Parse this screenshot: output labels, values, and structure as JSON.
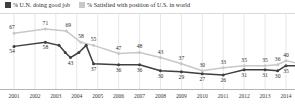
{
  "legend": {
    "series": [
      {
        "label": "% U.N. doing good job",
        "color": "#3f3f3f",
        "swatch": "dark"
      },
      {
        "label": "% Satisfied with position of U.S. in world",
        "color": "#c8c8c8",
        "swatch": "light"
      }
    ]
  },
  "axis": {
    "years": [
      "2001",
      "2002",
      "2003",
      "2004",
      "2005",
      "2006",
      "2007",
      "2008",
      "2009",
      "2010",
      "2011",
      "2012",
      "2013",
      "2014"
    ]
  },
  "chart_data": {
    "type": "line",
    "title": "",
    "subtitle": "",
    "xlabel": "",
    "ylabel": "",
    "ylim": [
      20,
      75
    ],
    "grid": "vertical-only",
    "legend_position": "top-left",
    "x_tick_labels": [
      "2001",
      "2002",
      "2003",
      "2004",
      "2005",
      "2006",
      "2007",
      "2008",
      "2009",
      "2010",
      "2011",
      "2012",
      "2013",
      "2014"
    ],
    "series": [
      {
        "name": "% U.N. doing good job",
        "color": "#3f3f3f",
        "points": [
          {
            "x": 2001.0,
            "value": 54
          },
          {
            "x": 2002.5,
            "value": 58
          },
          {
            "x": 2003.15,
            "value": 55
          },
          {
            "x": 2003.45,
            "value": 48
          },
          {
            "x": 2003.7,
            "value": 43
          },
          {
            "x": 2004.1,
            "value": 48
          },
          {
            "x": 2004.45,
            "value": 55
          },
          {
            "x": 2004.8,
            "value": 37
          },
          {
            "x": 2006.0,
            "value": 36
          },
          {
            "x": 2007.0,
            "value": 36
          },
          {
            "x": 2008.0,
            "value": 30
          },
          {
            "x": 2009.0,
            "value": 29
          },
          {
            "x": 2010.0,
            "value": 27
          },
          {
            "x": 2011.0,
            "value": 26
          },
          {
            "x": 2012.0,
            "value": 31
          },
          {
            "x": 2013.0,
            "value": 31
          },
          {
            "x": 2013.6,
            "value": 30
          },
          {
            "x": 2014.0,
            "value": 35
          },
          {
            "x": 2014.6,
            "value": 35
          }
        ],
        "labels": [
          54,
          58,
          43,
          37,
          36,
          36,
          30,
          29,
          27,
          26,
          31,
          31,
          30,
          35,
          35
        ]
      },
      {
        "name": "% Satisfied with position of U.S. in world",
        "color": "#c8c8c8",
        "points": [
          {
            "x": 2001.0,
            "value": 67
          },
          {
            "x": 2002.5,
            "value": 71
          },
          {
            "x": 2003.5,
            "value": 69
          },
          {
            "x": 2004.2,
            "value": 58
          },
          {
            "x": 2004.8,
            "value": 55
          },
          {
            "x": 2006.0,
            "value": 47
          },
          {
            "x": 2007.0,
            "value": 48
          },
          {
            "x": 2008.0,
            "value": 43
          },
          {
            "x": 2009.0,
            "value": 37
          },
          {
            "x": 2010.0,
            "value": 30
          },
          {
            "x": 2011.0,
            "value": 33
          },
          {
            "x": 2012.0,
            "value": 35
          },
          {
            "x": 2013.0,
            "value": 35
          },
          {
            "x": 2013.6,
            "value": 36
          },
          {
            "x": 2014.0,
            "value": 40
          },
          {
            "x": 2014.6,
            "value": 37
          }
        ],
        "labels": [
          67,
          71,
          69,
          58,
          55,
          47,
          48,
          43,
          37,
          30,
          33,
          35,
          35,
          36,
          40,
          37
        ]
      }
    ]
  }
}
